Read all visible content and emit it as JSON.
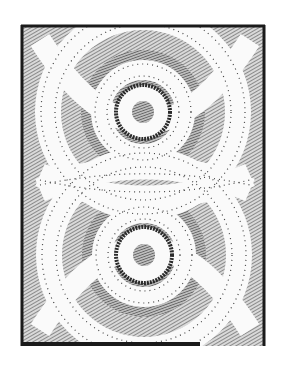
{
  "image": {
    "subject": "black-and-white print of two stacked concentric-circle motifs framed by interlacing dotted bands",
    "colors": {
      "background": "#ffffff",
      "ink": "#1a1a1a",
      "hatch": "#6b6b6b",
      "band": "#fafafa",
      "dots": "#444444"
    },
    "frame": {
      "x": 21,
      "y": 25,
      "width": 244,
      "height": 321
    },
    "motifs": [
      {
        "name": "upper",
        "cx": 143,
        "cy": 112,
        "inner_r": 11,
        "ring_r": 27
      },
      {
        "name": "lower",
        "cx": 144,
        "cy": 255,
        "inner_r": 11,
        "ring_r": 28
      }
    ]
  }
}
